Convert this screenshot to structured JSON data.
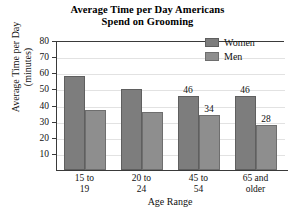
{
  "chart_data": {
    "type": "bar",
    "title": "Average Time per Day Americans Spend on Grooming",
    "title_line1": "Average Time per Day Americans",
    "title_line2": "Spend on Grooming",
    "xlabel": "Age Range",
    "ylabel": "Average Time per Day (minutes)",
    "ylabel_line1": "Average Time per Day",
    "ylabel_line2": "(minutes)",
    "categories": [
      "15 to 19",
      "20 to 24",
      "45 to 54",
      "65 and older"
    ],
    "categories_split": [
      {
        "l1": "15 to",
        "l2": "19"
      },
      {
        "l1": "20 to",
        "l2": "24"
      },
      {
        "l1": "45 to",
        "l2": "54"
      },
      {
        "l1": "65 and",
        "l2": "older"
      }
    ],
    "series": [
      {
        "name": "Women",
        "color": "#7d7d7d",
        "values": [
          58,
          50,
          46,
          46
        ],
        "labels": [
          "",
          "",
          "46",
          "46"
        ]
      },
      {
        "name": "Men",
        "color": "#8e8e8e",
        "values": [
          37,
          36,
          34,
          28
        ],
        "labels": [
          "",
          "",
          "34",
          "28"
        ]
      }
    ],
    "ylim": [
      0,
      80
    ],
    "yticks": [
      80,
      70,
      60,
      50,
      40,
      30,
      20,
      10
    ],
    "ytick_labels": [
      "80",
      "70",
      "60",
      "50",
      "40",
      "30",
      "20",
      "10"
    ],
    "grid": true,
    "legend_position": "top-right",
    "legend_entries": [
      "Women",
      "Men"
    ]
  }
}
